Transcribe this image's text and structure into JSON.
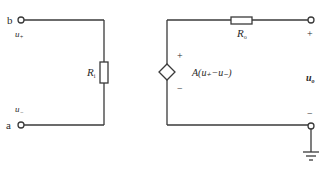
{
  "diagram": {
    "type": "circuit",
    "colors": {
      "wire": "#3a3a3a",
      "background": "#ffffff"
    },
    "input_side": {
      "terminal_b": {
        "label": "b"
      },
      "terminal_a": {
        "label": "a"
      },
      "u_plus": {
        "label": "u",
        "sub": "+"
      },
      "u_minus": {
        "label": "u",
        "sub": "−"
      },
      "input_resistor": {
        "label": "R",
        "sub": "i"
      }
    },
    "output_side": {
      "dependent_source": {
        "label": "A(u₊−u₋)",
        "plus": "+",
        "minus": "−"
      },
      "output_resistor": {
        "label": "R",
        "sub": "o"
      },
      "output_voltage": {
        "label": "u",
        "sub": "o",
        "plus": "+",
        "minus": "−"
      },
      "ground": {
        "symbol": "ground"
      }
    }
  }
}
